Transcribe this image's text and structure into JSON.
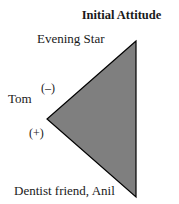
{
  "diagram": {
    "title": "Initial Attitude",
    "nodes": {
      "top": {
        "label": "Evening Star"
      },
      "left": {
        "label": "Tom"
      },
      "bottom": {
        "label": "Dentist friend, Anil"
      }
    },
    "edges": {
      "left_top": {
        "sign": "(–)"
      },
      "left_bottom": {
        "sign": "(+)"
      }
    },
    "triangle": {
      "fill": "#7f7f7f",
      "stroke": "#000000",
      "points": "136,41 47,119 136,197"
    }
  }
}
